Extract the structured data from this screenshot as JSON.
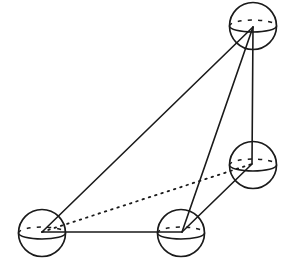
{
  "diagram": {
    "stroke_color": "#1a1a1a",
    "background": "#ffffff",
    "sphere_radius": 23.5,
    "equator_ry": 6,
    "nodes": [
      {
        "id": "A",
        "name": "top-sphere",
        "cx": 253,
        "cy": 26,
        "px": 253,
        "py": 27
      },
      {
        "id": "B",
        "name": "bottom-left-sphere",
        "cx": 42,
        "cy": 233,
        "px": 42,
        "py": 232
      },
      {
        "id": "C",
        "name": "bottom-middle-sphere",
        "cx": 181,
        "cy": 233,
        "px": 182,
        "py": 232
      },
      {
        "id": "D",
        "name": "right-sphere",
        "cx": 253,
        "cy": 165,
        "px": 252,
        "py": 164
      }
    ],
    "edges": [
      {
        "from": "A",
        "to": "B",
        "style": "solid"
      },
      {
        "from": "A",
        "to": "C",
        "style": "solid"
      },
      {
        "from": "A",
        "to": "D",
        "style": "solid"
      },
      {
        "from": "B",
        "to": "C",
        "style": "solid"
      },
      {
        "from": "C",
        "to": "D",
        "style": "solid"
      },
      {
        "from": "B",
        "to": "D",
        "style": "dotted"
      }
    ]
  }
}
